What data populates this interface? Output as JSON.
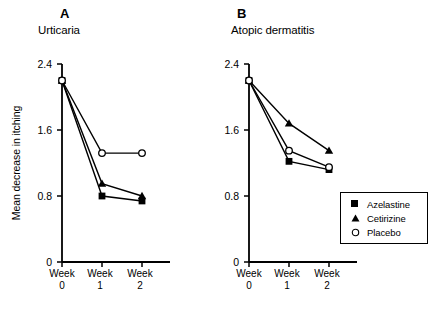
{
  "figure": {
    "ylabel": "Mean decrease in itching"
  },
  "legend": {
    "items": [
      {
        "label": "Azelastine",
        "marker": "filled-square"
      },
      {
        "label": "Cetirizine",
        "marker": "filled-triangle"
      },
      {
        "label": "Placebo",
        "marker": "open-circle"
      }
    ]
  },
  "chart_data": [
    {
      "type": "line",
      "panel": "A",
      "title": "Urticaria",
      "categories": [
        "Week\n0",
        "Week\n1",
        "Week\n2"
      ],
      "x": [
        "Week 0",
        "Week 1",
        "Week 2"
      ],
      "xtick_top": [
        "Week",
        "Week",
        "Week"
      ],
      "xtick_bottom": [
        "0",
        "1",
        "2"
      ],
      "xlabel": "",
      "ylabel": "Mean decrease in itching",
      "yticks": [
        "0",
        "0.8",
        "1.6",
        "2.4"
      ],
      "ytickvals": [
        0,
        0.8,
        1.6,
        2.4
      ],
      "ylim": [
        0,
        2.4
      ],
      "grid": false,
      "legend_position": "none",
      "series": [
        {
          "name": "Azelastine",
          "marker": "filled-square",
          "values": [
            2.2,
            0.8,
            0.74
          ]
        },
        {
          "name": "Cetirizine",
          "marker": "filled-triangle",
          "values": [
            2.2,
            0.95,
            0.8
          ]
        },
        {
          "name": "Placebo",
          "marker": "open-circle",
          "values": [
            2.2,
            1.32,
            1.32
          ]
        }
      ]
    },
    {
      "type": "line",
      "panel": "B",
      "title": "Atopic dermatitis",
      "categories": [
        "Week\n0",
        "Week\n1",
        "Week\n2"
      ],
      "x": [
        "Week 0",
        "Week 1",
        "Week 2"
      ],
      "xtick_top": [
        "Week",
        "Week",
        "Week"
      ],
      "xtick_bottom": [
        "0",
        "1",
        "2"
      ],
      "xlabel": "",
      "ylabel": "",
      "yticks": [
        "0",
        "0.8",
        "1.6",
        "2.4"
      ],
      "ytickvals": [
        0,
        0.8,
        1.6,
        2.4
      ],
      "ylim": [
        0,
        2.4
      ],
      "grid": false,
      "legend_position": "lower right",
      "series": [
        {
          "name": "Azelastine",
          "marker": "filled-square",
          "values": [
            2.2,
            1.22,
            1.12
          ]
        },
        {
          "name": "Cetirizine",
          "marker": "filled-triangle",
          "values": [
            2.2,
            1.68,
            1.35
          ]
        },
        {
          "name": "Placebo",
          "marker": "open-circle",
          "values": [
            2.2,
            1.35,
            1.15
          ]
        }
      ]
    }
  ],
  "colors": {
    "line": "#000000",
    "background": "#ffffff",
    "text": "#000000"
  }
}
